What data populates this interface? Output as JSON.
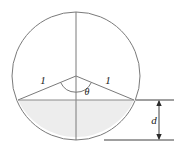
{
  "figure": {
    "kind": "geometry-diagram",
    "labels": {
      "radius_left": "1",
      "radius_right": "1",
      "central_angle": "θ",
      "depth": "d"
    },
    "colors": {
      "stroke": "#7a7a7a",
      "chord_stroke": "#8a8a8a",
      "segment_fill": "#ededed",
      "dimension_stroke": "#2b2b2b",
      "text": "#1a1a1a",
      "background": "#ffffff"
    },
    "geometry": {
      "circle_center_x": 76,
      "circle_center_y": 76,
      "circle_radius": 64,
      "chord_left_x": 18,
      "chord_left_y": 100,
      "chord_right_x": 134,
      "chord_right_y": 100,
      "vertical_diameter_top_y": 12,
      "vertical_diameter_bottom_y": 140,
      "angle_arc_radius": 17,
      "dimension_line_x": 159,
      "dimension_top_y": 100,
      "dimension_bottom_y": 140
    }
  }
}
